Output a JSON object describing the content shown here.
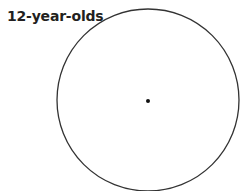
{
  "label": "12-year-olds",
  "circle": {
    "cx": 148,
    "cy": 100,
    "r": 91,
    "stroke": "#333333",
    "stroke_width": 1.3
  },
  "center_point": {
    "cx": 148,
    "cy": 101,
    "r": 2,
    "fill": "#111111"
  }
}
